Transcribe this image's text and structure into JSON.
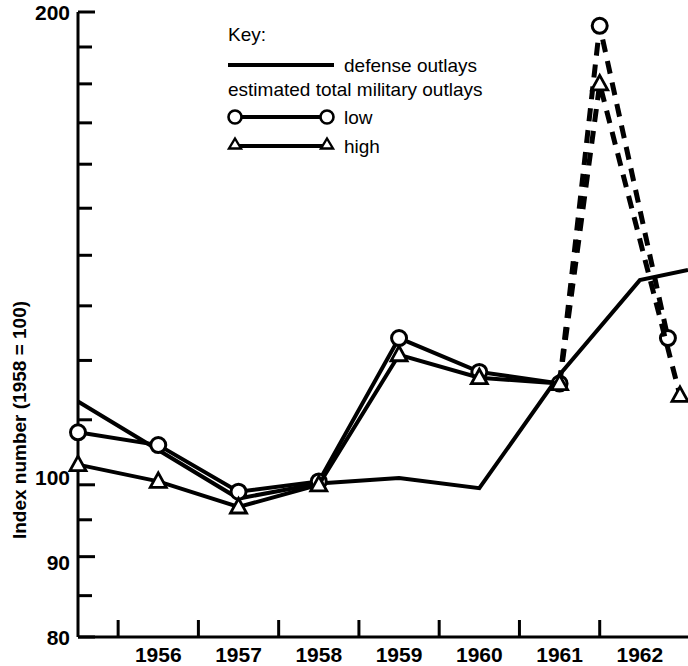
{
  "chart_data": {
    "type": "line",
    "title": "",
    "xlabel": "",
    "ylabel": "Index number (1958 = 100)",
    "scale": "log",
    "ylim": [
      80,
      200
    ],
    "ytick_labels": [
      "200",
      "100",
      "90",
      "80"
    ],
    "ytick_values": [
      200,
      100,
      90,
      80
    ],
    "yminor_ticks": [
      190,
      180,
      170,
      160,
      150,
      140,
      130,
      120,
      110,
      95,
      85
    ],
    "xtick_labels": [
      "1956",
      "1957",
      "1958",
      "1959",
      "1960",
      "1961",
      "1962"
    ],
    "x_range": [
      1955,
      1962.6
    ],
    "grid": false,
    "legend_position": "top-center",
    "legend": {
      "title": "Key:",
      "line_entry": "defense outlays",
      "group_label": "estimated total military outlays",
      "marker_entries": [
        {
          "marker": "circle",
          "label": "low"
        },
        {
          "marker": "triangle",
          "label": "high"
        }
      ]
    },
    "series": [
      {
        "name": "defense outlays",
        "style": "solid",
        "marker": "none",
        "x": [
          1955.0,
          1957.0,
          1958.0,
          1959.0,
          1960.0,
          1961.0,
          1962.0,
          1962.6
        ],
        "values": [
          113.0,
          98.0,
          100.2,
          101.0,
          99.5,
          117.5,
          135.0,
          137.0
        ]
      },
      {
        "name": "estimated total military outlays - low",
        "style": "solid-then-dashed",
        "marker": "circle",
        "dash_from_index": 6,
        "x": [
          1955.0,
          1956.0,
          1957.0,
          1958.0,
          1959.0,
          1960.0,
          1961.0,
          1961.5,
          1962.35
        ],
        "values": [
          108.0,
          106.0,
          99.0,
          100.5,
          124.0,
          118.0,
          116.0,
          196.0,
          124.0
        ]
      },
      {
        "name": "estimated total military outlays - high",
        "style": "solid-then-dashed",
        "marker": "triangle",
        "dash_from_index": 6,
        "x": [
          1955.0,
          1956.0,
          1957.0,
          1958.0,
          1959.0,
          1960.0,
          1961.0,
          1961.5,
          1962.5
        ],
        "values": [
          103.0,
          100.5,
          96.8,
          100.0,
          121.0,
          117.0,
          116.0,
          180.0,
          114.0
        ]
      }
    ]
  },
  "axis": {
    "y_title": "Index number (1958 = 100)",
    "y_labels": {
      "top": "200",
      "hundred": "100",
      "ninety": "90",
      "eighty": "80"
    },
    "x_labels": {
      "y1956": "1956",
      "y1957": "1957",
      "y1958": "1958",
      "y1959": "1959",
      "y1960": "1960",
      "y1961": "1961",
      "y1962": "1962"
    }
  },
  "colors": {
    "ink": "#000000",
    "background": "#ffffff"
  }
}
